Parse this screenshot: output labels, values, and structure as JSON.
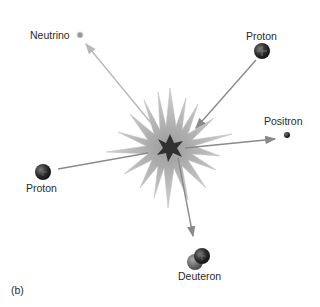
{
  "diagram": {
    "panel_label": "(b)",
    "center_event": "fusion-burst",
    "particles": [
      {
        "id": "neutrino",
        "label": "Neutrino",
        "role": "outgoing",
        "symbol": ""
      },
      {
        "id": "proton_top",
        "label": "Proton",
        "role": "incoming",
        "symbol": "+"
      },
      {
        "id": "positron",
        "label": "Positron",
        "role": "outgoing",
        "symbol": ""
      },
      {
        "id": "proton_left",
        "label": "Proton",
        "role": "incoming",
        "symbol": "+"
      },
      {
        "id": "deuteron",
        "label": "Deuteron",
        "role": "outgoing",
        "symbol": "+"
      }
    ],
    "colors": {
      "burst_outer": "#c4c4c4",
      "burst_inner": "#333333",
      "arrow": "#8a8a8a",
      "neutrino_arrow": "#b8b8b8",
      "particle_dark": "#2e2e2e",
      "neutrino_dot": "#9a9a9a"
    }
  }
}
